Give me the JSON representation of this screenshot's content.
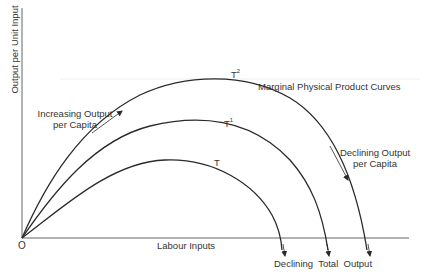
{
  "diagram": {
    "title": "Marginal Physical Product Curves",
    "axes": {
      "x_label": "Labour Inputs",
      "y_label": "Output per Unit Input",
      "origin_label": "O"
    },
    "curves": [
      {
        "label": "T",
        "superscript": ""
      },
      {
        "label": "T",
        "superscript": "1"
      },
      {
        "label": "T",
        "superscript": "2"
      }
    ],
    "annotations": {
      "increasing_line1": "Increasing Output",
      "increasing_line2": "per Capita",
      "declining_capita_line1": "Declining Output",
      "declining_capita_line2": "per Capita",
      "declining_total": "Declining  Total  Output"
    },
    "colors": {
      "line": "#2a2a2a",
      "axis": "#555555",
      "background": "#ffffff"
    }
  }
}
